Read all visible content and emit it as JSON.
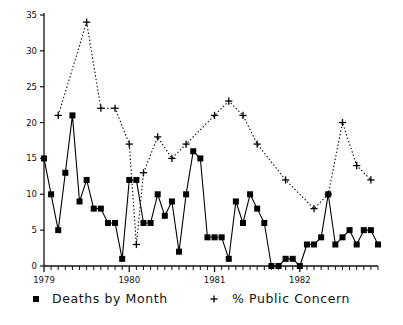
{
  "chart_data": {
    "type": "line",
    "title": "",
    "subtitle": "",
    "xlabel": "",
    "ylabel": "",
    "x_tick_labels": [
      "1979",
      "1980",
      "1981",
      "1982"
    ],
    "x_tick_values": [
      0,
      12,
      24,
      36
    ],
    "xlim": [
      0,
      47
    ],
    "y_tick_labels": [
      "0",
      "5",
      "10",
      "15",
      "20",
      "25",
      "30",
      "35"
    ],
    "y_tick_values": [
      0,
      5,
      10,
      15,
      20,
      25,
      30,
      35
    ],
    "ylim": [
      0,
      35
    ],
    "grid": false,
    "legend_position": "bottom",
    "x": [
      0,
      1,
      2,
      3,
      4,
      5,
      6,
      7,
      8,
      9,
      10,
      11,
      12,
      13,
      14,
      15,
      16,
      17,
      18,
      19,
      20,
      21,
      22,
      23,
      24,
      25,
      26,
      27,
      28,
      29,
      30,
      31,
      32,
      33,
      34,
      35,
      36,
      37,
      38,
      39,
      40,
      41,
      42,
      43,
      44,
      45,
      46,
      47
    ],
    "series": [
      {
        "name": "Deaths by Month",
        "marker": "square",
        "line_style": "solid",
        "color": "#000000",
        "x": [
          0,
          1,
          2,
          3,
          4,
          5,
          6,
          7,
          8,
          9,
          10,
          11,
          12,
          13,
          14,
          15,
          16,
          17,
          18,
          19,
          20,
          21,
          22,
          23,
          24,
          25,
          26,
          27,
          28,
          29,
          30,
          31,
          32,
          33,
          34,
          35,
          36,
          37,
          38,
          39,
          40,
          41,
          42,
          43,
          44,
          45,
          46,
          47
        ],
        "values": [
          15,
          10,
          5,
          13,
          21,
          9,
          12,
          8,
          8,
          6,
          6,
          1,
          12,
          12,
          6,
          6,
          10,
          7,
          9,
          2,
          10,
          16,
          15,
          4,
          4,
          4,
          1,
          9,
          6,
          10,
          8,
          6,
          0,
          0,
          1,
          1,
          0,
          3,
          3,
          4,
          10,
          3,
          4,
          5,
          3,
          5,
          5,
          3
        ]
      },
      {
        "name": "% Public Concern",
        "marker": "plus",
        "line_style": "dotted",
        "color": "#000000",
        "x": [
          2,
          6,
          8,
          10,
          12,
          13,
          14,
          16,
          18,
          20,
          24,
          26,
          28,
          30,
          34,
          38,
          40,
          42,
          44,
          46
        ],
        "values": [
          21,
          34,
          22,
          22,
          17,
          3,
          13,
          18,
          15,
          17,
          21,
          23,
          21,
          17,
          12,
          8,
          10,
          20,
          14,
          12
        ]
      }
    ],
    "legend": [
      {
        "label": "Deaths by Month",
        "marker": "square"
      },
      {
        "label": "% Public Concern",
        "marker": "plus"
      }
    ]
  }
}
